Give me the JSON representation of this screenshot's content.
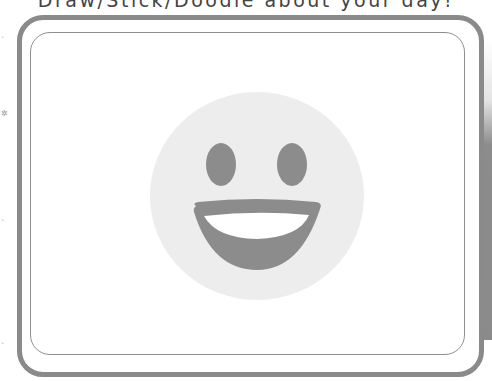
{
  "page": {
    "prompt": "Draw/Stick/Doodle about your day!"
  },
  "margin_marks": [
    {
      "glyph": "ˎ",
      "top": 30
    },
    {
      "glyph": "✲",
      "top": 110
    },
    {
      "glyph": "ˎ",
      "top": 213
    },
    {
      "glyph": "ˎ",
      "top": 336
    }
  ],
  "illustration": {
    "icon": "grinning-face-icon",
    "face_color": "#ededed",
    "feature_color": "#8c8c8c",
    "teeth_color": "#ffffff"
  },
  "frame": {
    "outer_color": "#8a8a8a",
    "inner_color": "#8f8f8f"
  }
}
